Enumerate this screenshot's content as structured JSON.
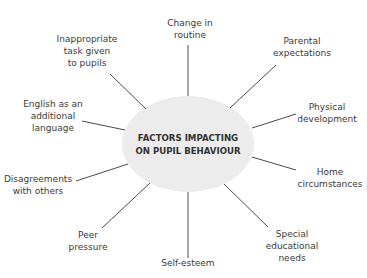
{
  "diagram": {
    "type": "spider-diagram",
    "center": {
      "line1": "FACTORS IMPACTING",
      "line2": "ON PUPIL BEHAVIOUR",
      "fill": "#ececec"
    },
    "line_color": "#4a4a4a",
    "factors": [
      {
        "lines": [
          "Change in",
          "routine"
        ]
      },
      {
        "lines": [
          "Parental",
          "expectations"
        ]
      },
      {
        "lines": [
          "Physical",
          "development"
        ]
      },
      {
        "lines": [
          "Home",
          "circumstances"
        ]
      },
      {
        "lines": [
          "Special",
          "educational",
          "needs"
        ]
      },
      {
        "lines": [
          "Self-esteem"
        ]
      },
      {
        "lines": [
          "Peer",
          "pressure"
        ]
      },
      {
        "lines": [
          "Disagreements",
          "with others"
        ]
      },
      {
        "lines": [
          "English as an",
          "additional",
          "language"
        ]
      },
      {
        "lines": [
          "Inappropriate",
          "task given",
          "to pupils"
        ]
      }
    ]
  }
}
